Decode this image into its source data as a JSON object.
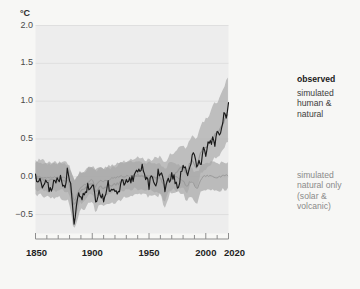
{
  "axes": {
    "unit_label": "°C",
    "y_ticks": [
      "2.0",
      "1.5",
      "1.0",
      "0.5",
      "0.0",
      "-0.5"
    ],
    "y_tick_values": [
      2.0,
      1.5,
      1.0,
      0.5,
      0.0,
      -0.5
    ],
    "x_ticks": [
      "1850",
      "1900",
      "1950",
      "2000",
      "2020"
    ],
    "x_tick_values": [
      1850,
      1900,
      1950,
      2000,
      2020
    ]
  },
  "legend": {
    "observed": "observed",
    "simulated_human_natural": "simulated\nhuman &\nnatural",
    "simulated_natural_only": "simulated\nnatural only\n(solar &\nvolcanic)"
  },
  "colors": {
    "page_background": "#f7f7f5",
    "plot_background": "#ededed",
    "gridline": "#dcdcdc",
    "axis": "#8d8d8d",
    "observed_line": "#1a1a1a",
    "human_natural_line": "#9a9a9a",
    "human_natural_band": "#b2b2b2",
    "natural_only_line": "#9a9a9a",
    "natural_only_band": "#a8a8a8",
    "tick_text": "#4a4a4a",
    "xtick_text": "#1f1f1f",
    "legend_observed_text": "#1a1a1a",
    "legend_human_text": "#3d3d3d",
    "legend_natural_text": "#8a8a8a"
  },
  "chart_data": {
    "type": "line",
    "title": "",
    "subtitle": "",
    "xlabel": "",
    "ylabel": "°C",
    "unit": "°C",
    "xlim": [
      1850,
      2020
    ],
    "ylim": [
      -0.75,
      2.0
    ],
    "grid": true,
    "gridlines_y": [
      2.0,
      1.5,
      1.0,
      0.5,
      0.0,
      -0.5
    ],
    "legend_position": "right-outside",
    "annotations": [
      "observed",
      "simulated human & natural",
      "simulated natural only (solar & volcanic)"
    ],
    "series": [
      {
        "name": "observed",
        "style": "line",
        "color": "#1a1a1a",
        "x": [
          1850,
          1852,
          1854,
          1856,
          1858,
          1860,
          1862,
          1864,
          1866,
          1868,
          1870,
          1872,
          1874,
          1876,
          1878,
          1880,
          1882,
          1884,
          1886,
          1888,
          1890,
          1892,
          1894,
          1896,
          1898,
          1900,
          1902,
          1904,
          1906,
          1908,
          1910,
          1912,
          1914,
          1916,
          1918,
          1920,
          1922,
          1924,
          1926,
          1928,
          1930,
          1932,
          1934,
          1936,
          1938,
          1940,
          1942,
          1944,
          1946,
          1948,
          1950,
          1952,
          1954,
          1956,
          1958,
          1960,
          1962,
          1964,
          1966,
          1968,
          1970,
          1972,
          1974,
          1976,
          1978,
          1980,
          1982,
          1984,
          1986,
          1988,
          1990,
          1992,
          1994,
          1996,
          1998,
          2000,
          2002,
          2004,
          2006,
          2008,
          2010,
          2012,
          2014,
          2016,
          2018,
          2020
        ],
        "y": [
          0.0,
          -0.05,
          0.02,
          -0.1,
          -0.08,
          -0.04,
          -0.18,
          -0.2,
          -0.05,
          -0.03,
          -0.08,
          0.01,
          -0.1,
          -0.14,
          0.1,
          -0.06,
          -0.09,
          -0.22,
          -0.18,
          -0.2,
          -0.27,
          -0.26,
          -0.24,
          -0.12,
          -0.2,
          -0.1,
          -0.16,
          -0.28,
          -0.18,
          -0.27,
          -0.28,
          -0.25,
          -0.1,
          -0.22,
          -0.18,
          -0.15,
          -0.18,
          -0.2,
          -0.04,
          -0.1,
          -0.05,
          -0.08,
          -0.03,
          -0.05,
          0.03,
          0.1,
          0.05,
          0.17,
          -0.01,
          -0.05,
          -0.12,
          0.02,
          -0.08,
          -0.12,
          0.06,
          0.0,
          0.04,
          -0.12,
          -0.02,
          -0.05,
          0.01,
          0.0,
          -0.12,
          -0.14,
          0.02,
          0.14,
          0.08,
          0.05,
          0.1,
          0.24,
          0.32,
          0.25,
          0.22,
          0.2,
          0.43,
          0.32,
          0.47,
          0.44,
          0.48,
          0.4,
          0.56,
          0.52,
          0.62,
          0.85,
          0.78,
          0.98
        ]
      },
      {
        "name": "simulated human & natural",
        "style": "line",
        "color": "#9a9a9a",
        "x": [
          1850,
          1860,
          1870,
          1880,
          1890,
          1900,
          1910,
          1920,
          1930,
          1940,
          1950,
          1960,
          1970,
          1980,
          1990,
          2000,
          2010,
          2020
        ],
        "y": [
          -0.02,
          -0.04,
          -0.05,
          -0.06,
          -0.18,
          -0.1,
          -0.14,
          -0.1,
          -0.05,
          0.02,
          -0.02,
          0.0,
          0.02,
          0.12,
          0.22,
          0.4,
          0.58,
          0.82
        ],
        "band_upper": [
          0.22,
          0.2,
          0.18,
          0.18,
          0.06,
          0.14,
          0.1,
          0.14,
          0.2,
          0.26,
          0.22,
          0.26,
          0.3,
          0.42,
          0.56,
          0.76,
          1.0,
          1.3
        ],
        "band_lower": [
          -0.24,
          -0.26,
          -0.28,
          -0.3,
          -0.44,
          -0.34,
          -0.38,
          -0.34,
          -0.28,
          -0.22,
          -0.26,
          -0.24,
          -0.22,
          -0.14,
          -0.06,
          0.1,
          0.26,
          0.46
        ]
      },
      {
        "name": "simulated natural only (solar & volcanic)",
        "style": "line",
        "color": "#9a9a9a",
        "x": [
          1850,
          1860,
          1870,
          1880,
          1890,
          1900,
          1910,
          1920,
          1930,
          1940,
          1950,
          1960,
          1970,
          1980,
          1990,
          2000,
          2010,
          2020
        ],
        "y": [
          0.0,
          -0.01,
          0.0,
          -0.02,
          -0.14,
          -0.04,
          -0.06,
          -0.01,
          0.01,
          0.02,
          0.0,
          -0.02,
          0.01,
          -0.04,
          -0.08,
          0.01,
          0.0,
          0.02
        ],
        "band_upper": [
          0.18,
          0.17,
          0.18,
          0.16,
          0.04,
          0.14,
          0.12,
          0.17,
          0.19,
          0.2,
          0.18,
          0.16,
          0.19,
          0.14,
          0.1,
          0.19,
          0.18,
          0.2
        ],
        "band_lower": [
          -0.18,
          -0.19,
          -0.18,
          -0.2,
          -0.34,
          -0.22,
          -0.24,
          -0.19,
          -0.17,
          -0.16,
          -0.18,
          -0.2,
          -0.17,
          -0.22,
          -0.26,
          -0.17,
          -0.18,
          -0.16
        ]
      }
    ]
  }
}
